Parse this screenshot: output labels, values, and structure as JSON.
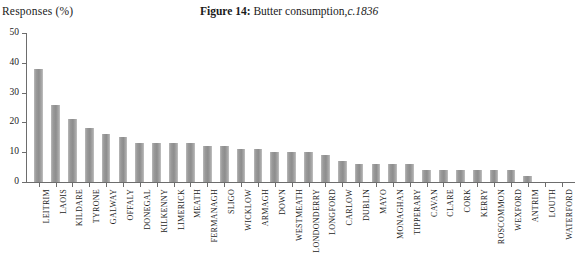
{
  "header": {
    "y_axis_title": "Responses (%)",
    "figure_label": "Figure 14:",
    "figure_caption": "Butter consumption,",
    "figure_circa": "c.1836"
  },
  "colors": {
    "bar_fill": "#9a9a9a",
    "axis": "#6d6d6d",
    "text": "#1a1a1a",
    "background": "#ffffff"
  },
  "chart_data": {
    "type": "bar",
    "xlabel": "",
    "ylabel": "Responses (%)",
    "ylim": [
      0,
      50
    ],
    "yticks": [
      0,
      10,
      20,
      30,
      40,
      50
    ],
    "grid": false,
    "legend": false,
    "categories": [
      "LEITRIM",
      "LAOIS",
      "KILDARE",
      "TYRONE",
      "GALWAY",
      "OFFALY",
      "DONEGAL",
      "KILKENNY",
      "LIMERICK",
      "MEATH",
      "FERMANAGH",
      "SLIGO",
      "WICKLOW",
      "ARMAGH",
      "DOWN",
      "WESTMEATH",
      "LONDONDERRY",
      "LONGFORD",
      "CARLOW",
      "DUBLIN",
      "MAYO",
      "MONAGHAN",
      "TIPPERARY",
      "CAVAN",
      "CLARE",
      "CORK",
      "KERRY",
      "ROSCOMMON",
      "WEXFORD",
      "ANTRIM",
      "LOUTH",
      "WATERFORD"
    ],
    "values": [
      38,
      26,
      21,
      18,
      16,
      15,
      13,
      13,
      13,
      13,
      12,
      12,
      11,
      11,
      10,
      10,
      10,
      9,
      7,
      6,
      6,
      6,
      6,
      4,
      4,
      4,
      4,
      4,
      4,
      2,
      0,
      0
    ]
  }
}
